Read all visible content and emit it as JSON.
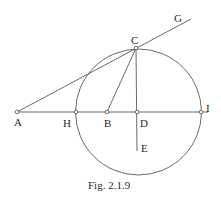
{
  "figure": {
    "caption": "Fig. 2.1.9",
    "labels": {
      "A": "A",
      "B": "B",
      "C": "C",
      "D": "D",
      "E": "E",
      "G": "G",
      "H": "H",
      "I": "I"
    },
    "points": {
      "A": [
        17,
        112
      ],
      "H": [
        76,
        112
      ],
      "B": [
        107,
        112
      ],
      "D": [
        137,
        112
      ],
      "I": [
        201,
        112
      ],
      "C": [
        136,
        48
      ],
      "E": [
        137,
        151
      ],
      "G": [
        191,
        19
      ]
    },
    "circle": {
      "cx": 138.5,
      "cy": 112,
      "r": 63
    },
    "colors": {
      "line": "#5a5a5a",
      "text": "#2a2a2a"
    }
  }
}
